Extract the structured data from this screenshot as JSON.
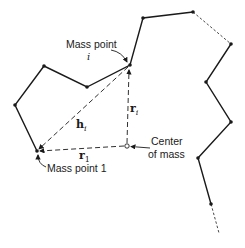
{
  "diagram": {
    "colors": {
      "line": "#1a1a1a",
      "background": "#ffffff"
    },
    "chain": {
      "solid_segments": [
        [
          [
            15,
            105
          ],
          [
            44,
            66
          ]
        ],
        [
          [
            44,
            66
          ],
          [
            87,
            87
          ]
        ],
        [
          [
            87,
            87
          ],
          [
            130,
            65
          ]
        ],
        [
          [
            130,
            65
          ],
          [
            143,
            18
          ]
        ],
        [
          [
            143,
            18
          ],
          [
            193,
            12
          ]
        ],
        [
          [
            231,
            44
          ],
          [
            206,
            82
          ]
        ],
        [
          [
            206,
            82
          ],
          [
            231,
            122
          ]
        ],
        [
          [
            231,
            122
          ],
          [
            198,
            158
          ]
        ],
        [
          [
            198,
            158
          ],
          [
            211,
            204
          ]
        ],
        [
          [
            15,
            105
          ],
          [
            37,
            151
          ]
        ]
      ],
      "dashed_segments": [
        [
          [
            193,
            12
          ],
          [
            231,
            44
          ]
        ],
        [
          [
            211,
            204
          ],
          [
            219,
            233
          ]
        ]
      ],
      "mass_points": [
        [
          37,
          151
        ],
        [
          15,
          105
        ],
        [
          44,
          66
        ],
        [
          87,
          87
        ],
        [
          130,
          65
        ],
        [
          143,
          18
        ],
        [
          193,
          12
        ],
        [
          231,
          44
        ],
        [
          206,
          82
        ],
        [
          231,
          122
        ],
        [
          198,
          158
        ],
        [
          211,
          204
        ]
      ]
    },
    "center_of_mass": [
      127,
      146
    ],
    "vectors": {
      "h_i": {
        "base": "h",
        "sub": "i"
      },
      "r_i": {
        "base": "r",
        "sub": "i"
      },
      "r_1": {
        "base": "r",
        "sub": "1"
      }
    },
    "labels": {
      "mass_point_i_line1": "Mass point",
      "mass_point_i_line2": "i",
      "center_line1": "Center",
      "center_line2": "of mass",
      "mass_point_1": "Mass point 1"
    }
  }
}
